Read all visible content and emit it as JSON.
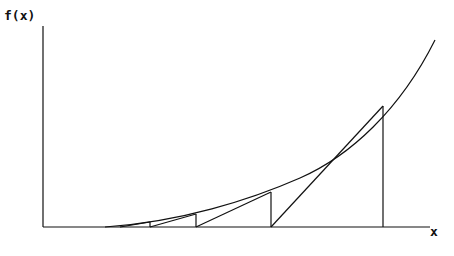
{
  "diagram": {
    "y_axis_label": "f(x)",
    "x_axis_label": "x",
    "colors": {
      "line": "#111111",
      "background": "#ffffff"
    },
    "axes": {
      "origin": [
        43,
        227
      ],
      "x_end": 432,
      "y_top": 26
    },
    "curve": {
      "type": "convex increasing",
      "start": [
        105,
        227
      ],
      "end": [
        435,
        40
      ]
    },
    "iterations": [
      {
        "x0": 383,
        "fx0_y": 106,
        "next_x": 271
      },
      {
        "x0": 271,
        "fx0_y": 192,
        "next_x": 196
      },
      {
        "x0": 196,
        "fx0_y": 214,
        "next_x": 150
      },
      {
        "x0": 150,
        "fx0_y": 222,
        "next_x": 120
      }
    ]
  }
}
